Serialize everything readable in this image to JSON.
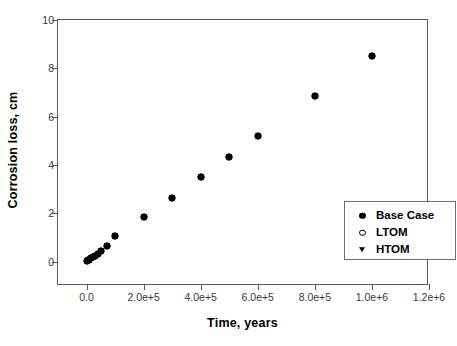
{
  "chart_data": {
    "type": "scatter",
    "title": "",
    "xlabel": "Time, years",
    "ylabel": "Corrosion loss, cm",
    "xlim": [
      -100000,
      1200000
    ],
    "ylim": [
      -1.0,
      10.0
    ],
    "grid": false,
    "legend_position": "center-right",
    "xticks": [
      {
        "value": 0,
        "label": "0.0"
      },
      {
        "value": 200000,
        "label": "2.0e+5"
      },
      {
        "value": 400000,
        "label": "4.0e+5"
      },
      {
        "value": 600000,
        "label": "6.0e+5"
      },
      {
        "value": 800000,
        "label": "8.0e+5"
      },
      {
        "value": 1000000,
        "label": "1.0e+6"
      },
      {
        "value": 1200000,
        "label": "1.2e+6"
      }
    ],
    "yticks": [
      {
        "value": 0,
        "label": "0"
      },
      {
        "value": 2,
        "label": "2"
      },
      {
        "value": 4,
        "label": "4"
      },
      {
        "value": 6,
        "label": "6"
      },
      {
        "value": 8,
        "label": "8"
      },
      {
        "value": 10,
        "label": "10"
      }
    ],
    "series": [
      {
        "name": "Base Case",
        "marker": "filled-circle",
        "color": "#000000",
        "x": [
          2000,
          6000,
          10000,
          16000,
          22000,
          30000,
          40000,
          52000,
          70000,
          100000,
          200000,
          300000,
          400000,
          500000,
          600000,
          800000,
          1000000
        ],
        "y": [
          0.02,
          0.06,
          0.09,
          0.14,
          0.19,
          0.26,
          0.34,
          0.45,
          0.64,
          1.05,
          1.85,
          2.65,
          3.5,
          4.35,
          5.2,
          6.85,
          8.5
        ]
      },
      {
        "name": "LTOM",
        "marker": "open-circle",
        "color": "#000000",
        "x": [
          2000,
          6000,
          10000,
          16000,
          22000,
          30000,
          40000,
          52000,
          70000,
          100000,
          200000,
          300000,
          400000,
          500000,
          600000,
          800000,
          1000000
        ],
        "y": [
          0.02,
          0.06,
          0.09,
          0.14,
          0.19,
          0.26,
          0.34,
          0.45,
          0.64,
          1.05,
          1.85,
          2.65,
          3.5,
          4.35,
          5.2,
          6.85,
          8.5
        ]
      },
      {
        "name": "HTOM",
        "marker": "filled-triangle-down",
        "color": "#000000",
        "x": [
          2000,
          6000,
          10000,
          16000,
          22000,
          30000,
          40000,
          52000,
          70000,
          100000,
          200000,
          300000,
          400000,
          500000,
          600000,
          800000,
          1000000
        ],
        "y": [
          0.02,
          0.06,
          0.09,
          0.14,
          0.19,
          0.26,
          0.34,
          0.45,
          0.64,
          1.05,
          1.85,
          2.65,
          3.5,
          4.35,
          5.2,
          6.85,
          8.5
        ]
      }
    ]
  },
  "legend": {
    "entries": [
      {
        "label": "Base Case",
        "marker": "filled-circle"
      },
      {
        "label": "LTOM",
        "marker": "open-circle"
      },
      {
        "label": "HTOM",
        "marker": "filled-triangle-down"
      }
    ]
  },
  "colors": {
    "marker": "#000000",
    "axis": "#5a5a5a",
    "tick_text": "#3a3a3a",
    "background": "#ffffff"
  }
}
